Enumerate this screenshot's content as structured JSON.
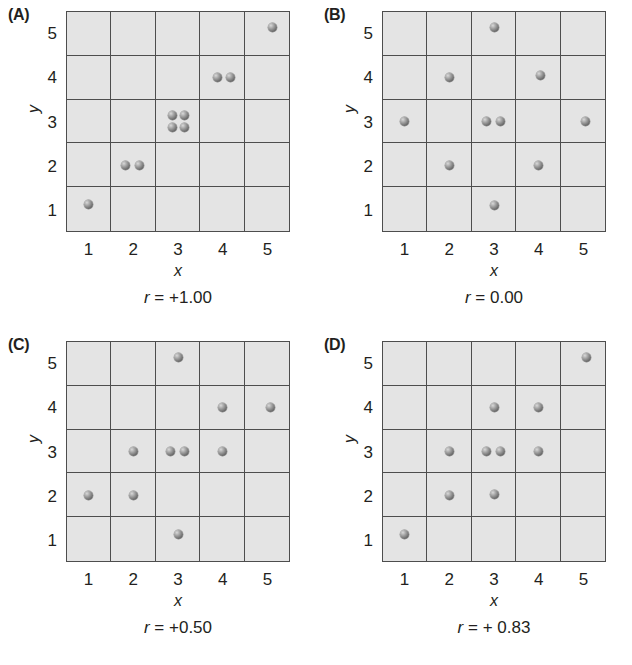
{
  "figure": {
    "axis_labels": {
      "x": "x",
      "y": "y"
    },
    "ticks": {
      "x": [
        "1",
        "2",
        "3",
        "4",
        "5"
      ],
      "y": [
        "1",
        "2",
        "3",
        "4",
        "5"
      ]
    }
  },
  "chart_data": {
    "type": "scatter",
    "title": "",
    "xlabel": "x",
    "ylabel": "y",
    "xlim": [
      0.5,
      5.5
    ],
    "ylim": [
      0.5,
      5.5
    ],
    "xticks": [
      1,
      2,
      3,
      4,
      5
    ],
    "yticks": [
      1,
      2,
      3,
      4,
      5
    ],
    "grid": true,
    "legend": "none",
    "panels": [
      {
        "label": "(A)",
        "caption_symbol": "r",
        "caption_value": " = +1.00",
        "caption_full": "r = +1.00",
        "r": 1.0,
        "points": [
          {
            "x": 1,
            "y": 1,
            "dx": 0,
            "dy": 0.12
          },
          {
            "x": 2,
            "y": 2,
            "dx": -0.17,
            "dy": 0
          },
          {
            "x": 2,
            "y": 2,
            "dx": 0.15,
            "dy": 0
          },
          {
            "x": 3,
            "y": 3,
            "dx": -0.13,
            "dy": 0.14
          },
          {
            "x": 3,
            "y": 3,
            "dx": 0.15,
            "dy": 0.14
          },
          {
            "x": 3,
            "y": 3,
            "dx": -0.13,
            "dy": -0.14
          },
          {
            "x": 3,
            "y": 3,
            "dx": 0.15,
            "dy": -0.14
          },
          {
            "x": 4,
            "y": 4,
            "dx": -0.12,
            "dy": 0
          },
          {
            "x": 4,
            "y": 4,
            "dx": 0.18,
            "dy": 0
          },
          {
            "x": 5,
            "y": 5,
            "dx": 0.1,
            "dy": 0.13
          }
        ]
      },
      {
        "label": "(B)",
        "caption_symbol": "r",
        "caption_value": " = 0.00",
        "caption_full": "r = 0.00",
        "r": 0.0,
        "points": [
          {
            "x": 3,
            "y": 5,
            "dx": 0,
            "dy": 0.13
          },
          {
            "x": 2,
            "y": 4,
            "dx": 0,
            "dy": 0
          },
          {
            "x": 4,
            "y": 4,
            "dx": 0.04,
            "dy": 0.04
          },
          {
            "x": 1,
            "y": 3,
            "dx": 0,
            "dy": 0
          },
          {
            "x": 3,
            "y": 3,
            "dx": -0.16,
            "dy": 0
          },
          {
            "x": 3,
            "y": 3,
            "dx": 0.14,
            "dy": 0
          },
          {
            "x": 5,
            "y": 3,
            "dx": 0.04,
            "dy": 0
          },
          {
            "x": 2,
            "y": 2,
            "dx": 0,
            "dy": 0
          },
          {
            "x": 4,
            "y": 2,
            "dx": 0,
            "dy": 0
          },
          {
            "x": 3,
            "y": 1,
            "dx": 0,
            "dy": 0.1
          }
        ]
      },
      {
        "label": "(C)",
        "caption_symbol": "r",
        "caption_value": " = +0.50",
        "caption_full": "r = +0.50",
        "r": 0.5,
        "points": [
          {
            "x": 3,
            "y": 5,
            "dx": 0,
            "dy": 0.13
          },
          {
            "x": 4,
            "y": 4,
            "dx": 0,
            "dy": 0
          },
          {
            "x": 5,
            "y": 4,
            "dx": 0.06,
            "dy": 0
          },
          {
            "x": 2,
            "y": 3,
            "dx": 0,
            "dy": 0
          },
          {
            "x": 3,
            "y": 3,
            "dx": -0.16,
            "dy": 0
          },
          {
            "x": 3,
            "y": 3,
            "dx": 0.14,
            "dy": 0
          },
          {
            "x": 4,
            "y": 3,
            "dx": 0,
            "dy": 0
          },
          {
            "x": 1,
            "y": 2,
            "dx": 0,
            "dy": 0
          },
          {
            "x": 2,
            "y": 2,
            "dx": 0,
            "dy": 0
          },
          {
            "x": 3,
            "y": 1,
            "dx": 0,
            "dy": 0.12
          }
        ]
      },
      {
        "label": "(D)",
        "caption_symbol": "r",
        "caption_value": " = + 0.83",
        "caption_full": "r = + 0.83",
        "r": 0.83,
        "points": [
          {
            "x": 5,
            "y": 5,
            "dx": 0.06,
            "dy": 0.13
          },
          {
            "x": 3,
            "y": 4,
            "dx": 0,
            "dy": 0
          },
          {
            "x": 4,
            "y": 4,
            "dx": 0,
            "dy": 0
          },
          {
            "x": 2,
            "y": 3,
            "dx": 0,
            "dy": 0
          },
          {
            "x": 3,
            "y": 3,
            "dx": -0.16,
            "dy": 0
          },
          {
            "x": 3,
            "y": 3,
            "dx": 0.14,
            "dy": 0
          },
          {
            "x": 4,
            "y": 3,
            "dx": 0,
            "dy": 0
          },
          {
            "x": 2,
            "y": 2,
            "dx": 0,
            "dy": 0
          },
          {
            "x": 3,
            "y": 2,
            "dx": 0,
            "dy": 0.03
          },
          {
            "x": 1,
            "y": 1,
            "dx": 0,
            "dy": 0.12
          }
        ]
      }
    ]
  }
}
